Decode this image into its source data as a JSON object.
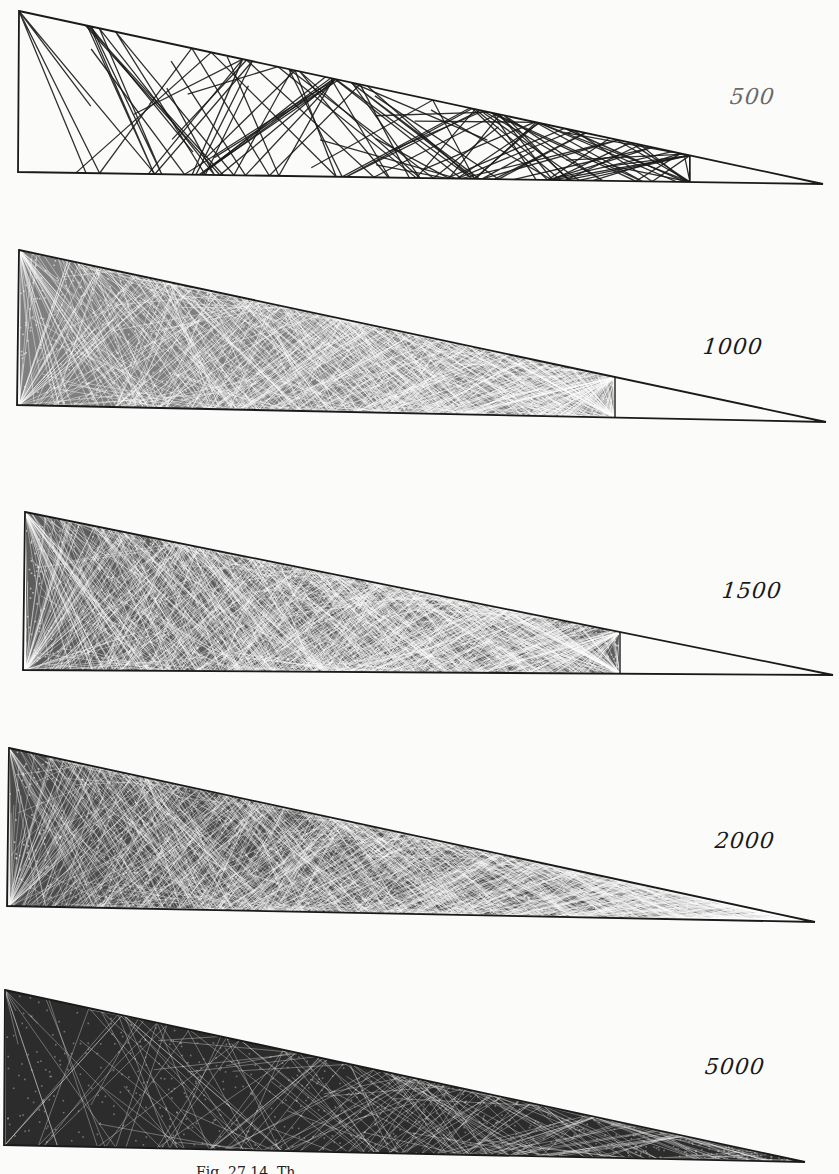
{
  "figure": {
    "type": "wedge-billiard ray-trajectory panels",
    "caption_partial": "Fig. 27.14. Th",
    "panels": [
      {
        "id": "panel-500",
        "label": "500",
        "reflections": 500,
        "top_left": [
          19,
          11
        ],
        "bottom_left": [
          18,
          172
        ],
        "tip": [
          823,
          184
        ],
        "fill_extent_x": 690,
        "density": "sparse",
        "label_pos": [
          730,
          88
        ],
        "label_faded": true
      },
      {
        "id": "panel-1000",
        "label": "1000",
        "reflections": 1000,
        "top_left": [
          19,
          250
        ],
        "bottom_left": [
          17,
          405
        ],
        "tip": [
          826,
          422
        ],
        "fill_extent_x": 615,
        "density": "medium",
        "label_pos": [
          703,
          337
        ],
        "label_faded": false
      },
      {
        "id": "panel-1500",
        "label": "1500",
        "reflections": 1500,
        "top_left": [
          25,
          512
        ],
        "bottom_left": [
          23,
          670
        ],
        "tip": [
          833,
          675
        ],
        "fill_extent_x": 620,
        "density": "dense",
        "label_pos": [
          722,
          580
        ],
        "label_faded": false
      },
      {
        "id": "panel-2000",
        "label": "2000",
        "reflections": 2000,
        "top_left": [
          9,
          748
        ],
        "bottom_left": [
          7,
          906
        ],
        "tip": [
          815,
          922
        ],
        "fill_extent_x": 800,
        "density": "very-dense",
        "label_pos": [
          715,
          830
        ],
        "label_faded": false
      },
      {
        "id": "panel-5000",
        "label": "5000",
        "reflections": 5000,
        "top_left": [
          5,
          990
        ],
        "bottom_left": [
          4,
          1145
        ],
        "tip": [
          805,
          1162
        ],
        "fill_extent_x": 805,
        "density": "saturated",
        "label_pos": [
          705,
          1055
        ],
        "label_faded": false
      }
    ]
  },
  "colors": {
    "ink": "#1a1a1a",
    "paper": "#fbfbfa"
  }
}
